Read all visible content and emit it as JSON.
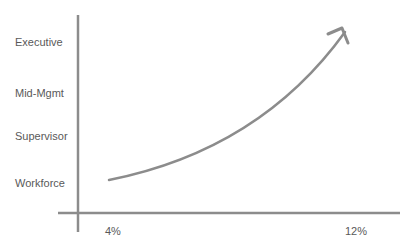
{
  "diagram": {
    "y_labels": [
      "Executive",
      "Mid-Mgmt",
      "Supervisor",
      "Workforce"
    ],
    "x_labels": [
      "4%",
      "12%"
    ],
    "line_color": "#8c8c8c",
    "text_color": "#595959",
    "curve": "exponential growth arrow from Workforce at 4% to Executive at 12%"
  }
}
